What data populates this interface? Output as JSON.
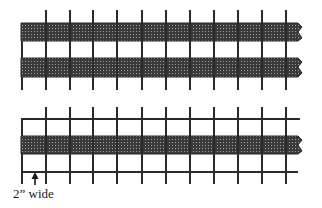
{
  "diagram": {
    "colors": {
      "line": "#2a2a2a",
      "band": "#3a3a3a",
      "band_grid": "#9a9a9a",
      "background": "#ffffff"
    },
    "top_figure": {
      "description": "Two parallel shaded strips woven over a series of vertical posts",
      "bands": 2,
      "posts": 11
    },
    "bottom_figure": {
      "description": "Single shaded strip between two horizontal rails across a grid of posts",
      "bands": 1,
      "posts": 11,
      "annotation": "2” wide"
    }
  }
}
